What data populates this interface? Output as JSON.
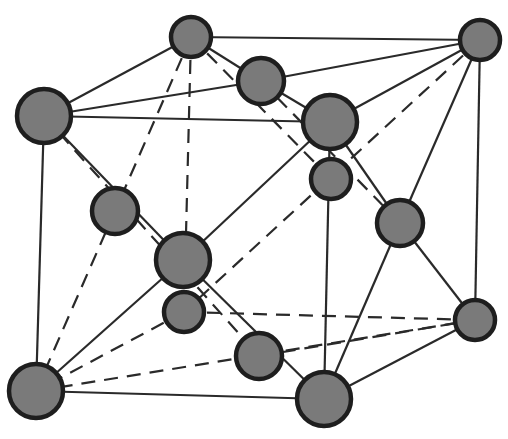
{
  "diagram": {
    "type": "crystal-lattice-unit-cell",
    "colors": {
      "background": "#ffffff",
      "atom_fill": "#7a7a7a",
      "atom_stroke": "#1e1e1e",
      "bond": "#2a2a2a"
    },
    "atoms": [
      {
        "id": "A0",
        "cx": 191,
        "cy": 37,
        "r": 20
      },
      {
        "id": "A1",
        "cx": 480,
        "cy": 40,
        "r": 20
      },
      {
        "id": "A2",
        "cx": 261,
        "cy": 81,
        "r": 23
      },
      {
        "id": "A3",
        "cx": 44,
        "cy": 116,
        "r": 27
      },
      {
        "id": "A4",
        "cx": 330,
        "cy": 122,
        "r": 27
      },
      {
        "id": "A5",
        "cx": 331,
        "cy": 179,
        "r": 20
      },
      {
        "id": "A6",
        "cx": 115,
        "cy": 211,
        "r": 23
      },
      {
        "id": "A7",
        "cx": 400,
        "cy": 223,
        "r": 23
      },
      {
        "id": "A8",
        "cx": 183,
        "cy": 260,
        "r": 27
      },
      {
        "id": "A9",
        "cx": 184,
        "cy": 312,
        "r": 20
      },
      {
        "id": "A10",
        "cx": 475,
        "cy": 320,
        "r": 20
      },
      {
        "id": "A11",
        "cx": 259,
        "cy": 356,
        "r": 23
      },
      {
        "id": "A12",
        "cx": 36,
        "cy": 391,
        "r": 27
      },
      {
        "id": "A13",
        "cx": 324,
        "cy": 399,
        "r": 27
      }
    ],
    "bonds_solid": [
      [
        "A0",
        "A1"
      ],
      [
        "A0",
        "A3"
      ],
      [
        "A0",
        "A2"
      ],
      [
        "A3",
        "A2"
      ],
      [
        "A3",
        "A4"
      ],
      [
        "A2",
        "A4"
      ],
      [
        "A1",
        "A2"
      ],
      [
        "A1",
        "A4"
      ],
      [
        "A1",
        "A10"
      ],
      [
        "A1",
        "A7"
      ],
      [
        "A3",
        "A12"
      ],
      [
        "A3",
        "A8"
      ],
      [
        "A4",
        "A8"
      ],
      [
        "A4",
        "A7"
      ],
      [
        "A4",
        "A13"
      ],
      [
        "A8",
        "A12"
      ],
      [
        "A8",
        "A13"
      ],
      [
        "A7",
        "A10"
      ],
      [
        "A7",
        "A13"
      ],
      [
        "A12",
        "A13"
      ],
      [
        "A13",
        "A10"
      ]
    ],
    "bonds_dashed": [
      [
        "A0",
        "A6"
      ],
      [
        "A0",
        "A9"
      ],
      [
        "A0",
        "A5"
      ],
      [
        "A1",
        "A9"
      ],
      [
        "A3",
        "A11"
      ],
      [
        "A6",
        "A12"
      ],
      [
        "A9",
        "A12"
      ],
      [
        "A12",
        "A10"
      ],
      [
        "A9",
        "A10"
      ],
      [
        "A11",
        "A10"
      ],
      [
        "A2",
        "A7"
      ]
    ]
  }
}
